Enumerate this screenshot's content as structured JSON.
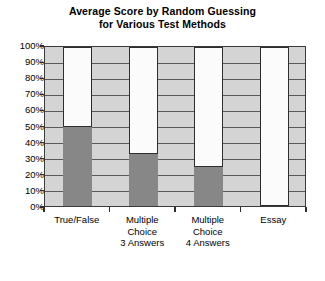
{
  "chart_data": {
    "type": "bar",
    "title": "Average Score by Random Guessing for Various Test Methods",
    "title_line1": "Average Score by Random Guessing",
    "title_line2": "for Various Test Methods",
    "xlabel": "",
    "ylabel": "",
    "ylim": [
      0,
      100
    ],
    "grid": true,
    "legend": "none",
    "y_tick_labels": [
      "100%",
      "90%",
      "80%",
      "70%",
      "60%",
      "50%",
      "40%",
      "30%",
      "20%",
      "10%",
      "0%"
    ],
    "y_tick_values": [
      100,
      90,
      80,
      70,
      60,
      50,
      40,
      30,
      20,
      10,
      0
    ],
    "categories": [
      "True/False",
      "Multiple Choice 3 Answers",
      "Multiple Choice 4 Answers",
      "Essay"
    ],
    "category_label_lines": [
      [
        "True/False"
      ],
      [
        "Multiple",
        "Choice",
        "3 Answers"
      ],
      [
        "Multiple",
        "Choice",
        "4 Answers"
      ],
      [
        "Essay"
      ]
    ],
    "values": [
      50,
      33,
      25,
      0
    ],
    "value_unit": "%",
    "colors": {
      "bar_fill": "#878787",
      "bar_outline": "#2e2e2e",
      "bar_background": "#fbfbfb",
      "plot_background": "#d4d4d4",
      "gridline": "#5a5a5a",
      "axis": "#2e2e2e",
      "text": "#000000",
      "page_background": "#ffffff"
    }
  }
}
